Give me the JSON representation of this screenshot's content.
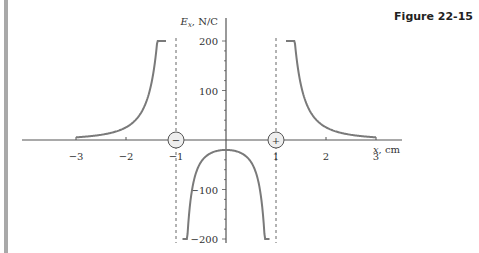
{
  "figure": {
    "label": "Figure 22-15"
  },
  "chart_data": {
    "type": "line",
    "title": "",
    "xlabel": "x, cm",
    "ylabel": "Ex, N/C",
    "ylabel_parts": {
      "symbol": "E",
      "subscript": "x",
      "units": ", N/C"
    },
    "xlim": [
      -3.7,
      3.7
    ],
    "ylim": [
      -200,
      200
    ],
    "x_ticks": [
      -3,
      -2,
      -1,
      1,
      2,
      3
    ],
    "x_tick_labels": [
      "−3",
      "−2",
      "−1",
      "1",
      "2",
      "3"
    ],
    "y_ticks": [
      200,
      100,
      -100,
      -200
    ],
    "y_tick_labels": [
      "200",
      "100",
      "−100",
      "−200"
    ],
    "grid": false,
    "charges": [
      {
        "x": -1,
        "sign": "−",
        "label": "negative charge"
      },
      {
        "x": 1,
        "sign": "+",
        "label": "positive charge"
      }
    ],
    "asymptotes": [
      -1,
      1
    ],
    "series": [
      {
        "name": "Ex (x < -1)",
        "x": [
          -3.0,
          -2.5,
          -2.0,
          -1.75,
          -1.5,
          -1.35,
          -1.25,
          -1.2
        ],
        "y": [
          2,
          6,
          14,
          24,
          48,
          85,
          130,
          200
        ]
      },
      {
        "name": "Ex (-1 < x < 1)",
        "x": [
          -0.88,
          -0.8,
          -0.6,
          -0.4,
          -0.2,
          0.0,
          0.2,
          0.4,
          0.6,
          0.8,
          0.88
        ],
        "y": [
          -200,
          -150,
          -85,
          -50,
          -28,
          -20,
          -28,
          -50,
          -85,
          -150,
          -200
        ]
      },
      {
        "name": "Ex (x > 1)",
        "x": [
          1.2,
          1.25,
          1.35,
          1.5,
          1.75,
          2.0,
          2.5,
          3.0
        ],
        "y": [
          200,
          130,
          85,
          48,
          24,
          14,
          6,
          2
        ]
      }
    ],
    "colors": {
      "curve": "#7a7a7a",
      "axis": "#555555",
      "asymptote": "#666666"
    }
  }
}
